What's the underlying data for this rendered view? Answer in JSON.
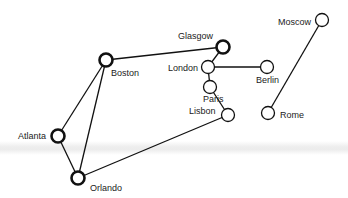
{
  "diagram": {
    "type": "network graph",
    "nodes": [
      {
        "id": "boston",
        "label": "Boston",
        "x": 106,
        "y": 60,
        "bold": true,
        "lx": 111,
        "ly": 68
      },
      {
        "id": "glasgow",
        "label": "Glasgow",
        "x": 223,
        "y": 47,
        "bold": true,
        "lx": 178,
        "ly": 31
      },
      {
        "id": "london",
        "label": "London",
        "x": 208,
        "y": 67,
        "bold": false,
        "lx": 168,
        "ly": 63
      },
      {
        "id": "berlin",
        "label": "Berlin",
        "x": 267,
        "y": 67,
        "bold": false,
        "lx": 256,
        "ly": 75
      },
      {
        "id": "paris",
        "label": "Paris",
        "x": 210,
        "y": 87,
        "bold": false,
        "lx": 203,
        "ly": 94
      },
      {
        "id": "lisbon",
        "label": "Lisbon",
        "x": 228,
        "y": 115,
        "bold": false,
        "lx": 189,
        "ly": 106
      },
      {
        "id": "moscow",
        "label": "Moscow",
        "x": 322,
        "y": 20,
        "bold": false,
        "lx": 278,
        "ly": 17
      },
      {
        "id": "rome",
        "label": "Rome",
        "x": 268,
        "y": 113,
        "bold": false,
        "lx": 280,
        "ly": 110
      },
      {
        "id": "atlanta",
        "label": "Atlanta",
        "x": 58,
        "y": 136,
        "bold": true,
        "lx": 18,
        "ly": 131
      },
      {
        "id": "orlando",
        "label": "Orlando",
        "x": 78,
        "y": 178,
        "bold": true,
        "lx": 90,
        "ly": 183
      }
    ],
    "edges": [
      [
        "boston",
        "glasgow"
      ],
      [
        "boston",
        "atlanta"
      ],
      [
        "boston",
        "orlando"
      ],
      [
        "atlanta",
        "orlando"
      ],
      [
        "orlando",
        "lisbon"
      ],
      [
        "lisbon",
        "paris"
      ],
      [
        "paris",
        "london"
      ],
      [
        "london",
        "glasgow"
      ],
      [
        "london",
        "berlin"
      ],
      [
        "moscow",
        "rome"
      ]
    ]
  }
}
